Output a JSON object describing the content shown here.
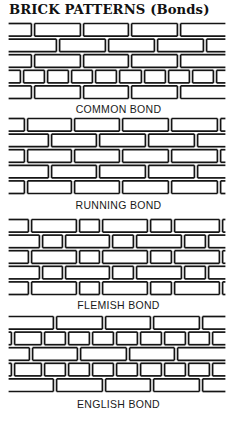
{
  "title": "BRICK PATTERNS (Bonds)",
  "colors": {
    "ink": "#141414",
    "mortar": "#ffffff"
  },
  "panel": {
    "x_start": 9,
    "x_end": 225,
    "course_height": 15.6
  },
  "bonds": [
    {
      "name": "COMMON BOND",
      "top": 22,
      "label_top": 103,
      "courses": [
        [
          33,
          82,
          130,
          179
        ],
        [
          58,
          107,
          156,
          205
        ],
        [
          33,
          82,
          130,
          179
        ],
        [
          22,
          46,
          70,
          94,
          118,
          143,
          167,
          191,
          215
        ],
        [
          33,
          82,
          130,
          179
        ]
      ]
    },
    {
      "name": "RUNNING BOND",
      "top": 117,
      "label_top": 199,
      "courses": [
        [
          26,
          73,
          121,
          170,
          219
        ],
        [
          50,
          98,
          147,
          196
        ],
        [
          26,
          73,
          121,
          170,
          219
        ],
        [
          50,
          98,
          147,
          196
        ],
        [
          26,
          73,
          121,
          170,
          219
        ]
      ]
    },
    {
      "name": "FLEMISH BOND",
      "top": 218,
      "label_top": 299,
      "courses": [
        [
          30,
          78,
          101,
          149,
          173,
          221
        ],
        [
          41,
          64,
          111,
          135,
          183,
          207
        ],
        [
          30,
          78,
          101,
          149,
          173,
          221
        ],
        [
          41,
          64,
          111,
          135,
          183,
          207
        ],
        [
          30,
          78,
          101,
          149,
          173,
          221
        ]
      ]
    },
    {
      "name": "ENGLISH BOND",
      "top": 315,
      "label_top": 398,
      "courses": [
        [
          55,
          104,
          152,
          201
        ],
        [
          13,
          43,
          67,
          91,
          115,
          139,
          163,
          187,
          211
        ],
        [
          31,
          79,
          128,
          176
        ],
        [
          13,
          43,
          67,
          91,
          115,
          139,
          163,
          187,
          211
        ],
        [
          55,
          104,
          152,
          201
        ]
      ]
    }
  ]
}
